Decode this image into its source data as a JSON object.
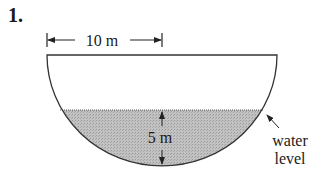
{
  "problem": {
    "number": "1."
  },
  "diagram": {
    "type": "semicircular tank cross-section",
    "width_label": "10 m",
    "depth_label": "5 m",
    "water_label_line1": "water",
    "water_label_line2": "level",
    "colors": {
      "outline": "#333333",
      "water_fill": "#b8b8b8",
      "background": "#ffffff"
    }
  }
}
